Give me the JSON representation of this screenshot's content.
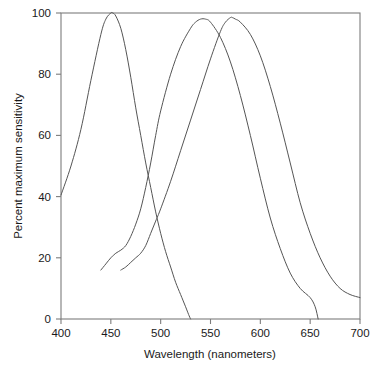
{
  "chart_data": {
    "type": "line",
    "title": "",
    "subtitle": "",
    "xlabel": "Wavelength (nanometers)",
    "ylabel": "Percent maximum sensitivity",
    "xlim": [
      400,
      700
    ],
    "ylim": [
      0,
      100
    ],
    "xticks": [
      400,
      450,
      500,
      550,
      600,
      650,
      700
    ],
    "yticks": [
      0,
      20,
      40,
      60,
      80,
      100
    ],
    "xtick_labels": [
      "400",
      "450",
      "500",
      "550",
      "600",
      "650",
      "700"
    ],
    "ytick_labels": [
      "0",
      "20",
      "40",
      "60",
      "80",
      "100"
    ],
    "grid": false,
    "legend": "none",
    "frame": "box",
    "line_color": "#555555",
    "axis_color": "#7d7d7d",
    "background": "#ffffff",
    "series": [
      {
        "name": "short-wavelength cone",
        "peak_x": 452,
        "peak_y": 100,
        "x": [
          400,
          410,
          420,
          430,
          440,
          445,
          450,
          452,
          455,
          460,
          465,
          470,
          475,
          480,
          485,
          490,
          495,
          500,
          505,
          510,
          515,
          520,
          525,
          528,
          530
        ],
        "values": [
          40.5,
          50,
          62,
          78,
          93,
          98,
          100,
          100,
          99,
          95,
          88,
          79,
          69,
          60,
          51,
          43,
          35,
          28,
          22,
          17,
          12,
          8,
          4,
          1.5,
          0
        ]
      },
      {
        "name": "medium-wavelength cone",
        "peak_x": 540,
        "peak_y": 98,
        "x": [
          440,
          445,
          450,
          455,
          460,
          465,
          470,
          475,
          480,
          485,
          490,
          495,
          500,
          510,
          520,
          530,
          535,
          540,
          545,
          550,
          560,
          570,
          580,
          590,
          600,
          610,
          620,
          630,
          640,
          650,
          655,
          658
        ],
        "values": [
          16,
          18,
          20,
          21.5,
          22.5,
          24,
          27,
          31,
          36,
          43,
          51,
          60,
          68,
          80,
          89,
          95,
          97,
          98,
          98,
          97,
          92,
          84,
          73,
          60,
          46,
          33,
          23,
          15,
          10,
          7,
          4,
          0
        ]
      },
      {
        "name": "long-wavelength cone",
        "peak_x": 572,
        "peak_y": 98.5,
        "x": [
          460,
          465,
          470,
          475,
          480,
          485,
          490,
          495,
          500,
          510,
          520,
          530,
          540,
          550,
          560,
          565,
          570,
          572,
          575,
          580,
          590,
          600,
          610,
          620,
          630,
          640,
          650,
          660,
          670,
          680,
          690,
          700
        ],
        "values": [
          16,
          17,
          18.5,
          20,
          21.5,
          24,
          28,
          32,
          36,
          45,
          55,
          65,
          75,
          85,
          94,
          97,
          98.5,
          98.5,
          98,
          97,
          93,
          86,
          76,
          64,
          51,
          38,
          28,
          20,
          14,
          10,
          8,
          7
        ]
      }
    ]
  },
  "axes": {
    "x_title": "Wavelength (nanometers)",
    "y_title": "Percent maximum sensitivity"
  }
}
